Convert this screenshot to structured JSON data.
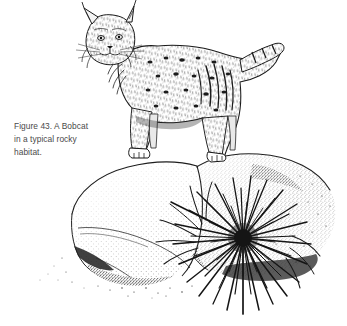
{
  "figure": {
    "caption_text": "Figure 43. A Bobcat\nin a typical rocky\nhabitat.",
    "caption_label": "Figure 43.",
    "caption_body": "A Bobcat in a typical rocky habitat.",
    "figure_number": "43",
    "background_color": "#ffffff",
    "ink_color": "#1a1a1a",
    "caption_color": "#4a4a4a",
    "medium": "pen-and-ink stipple illustration",
    "width_px": "347",
    "height_px": "326"
  },
  "subjects": {
    "animal": {
      "name": "Bobcat",
      "pose": "standing on rock, facing viewer, body in profile to the right",
      "features": "tufted pointed ears, facial ruff, spotted and barred fur, short bobbed tail"
    },
    "rocks": {
      "name": "rocky outcrop",
      "description": "two large boulders rendered in stipple, front boulder lighter, rear boulder darker"
    },
    "plant": {
      "name": "sotol",
      "description": "spiky rosette of radiating blade-like leaves at right base of rocks"
    }
  }
}
